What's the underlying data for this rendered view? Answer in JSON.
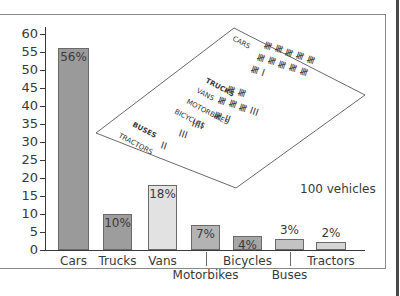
{
  "chart_data": {
    "type": "bar",
    "title": "",
    "xlabel": "",
    "ylabel": "",
    "ylim": [
      0,
      60
    ],
    "yticks": [
      0,
      5,
      10,
      15,
      20,
      25,
      30,
      35,
      40,
      45,
      50,
      55,
      60
    ],
    "categories": [
      "Cars",
      "Trucks",
      "Vans",
      "Motorbikes",
      "Bicycles",
      "Buses",
      "Tractors"
    ],
    "values": [
      56,
      10,
      18,
      7,
      4,
      3,
      2
    ],
    "value_labels": [
      "56%",
      "10%",
      "18%",
      "7%",
      "4%",
      "3%",
      "2%"
    ],
    "colors": [
      "#9a9a9a",
      "#9d9d9d",
      "#e2e2e2",
      "#b3b3b3",
      "#a6a6a6",
      "#c3c3c3",
      "#d6d6d6"
    ],
    "annotation": "100 vehicles",
    "grid": false,
    "legend": null
  },
  "paper": {
    "rows": [
      {
        "label": "CARS",
        "tally": "卌 卌 卌 卌 卌 卌 卌 卌 卌 卌 卌 I"
      },
      {
        "label": "TRUCKS",
        "tally": "卌 卌"
      },
      {
        "label": "VANS",
        "tally": "卌 卌 卌 III"
      },
      {
        "label": "MOTORBIKES",
        "tally": "卌 II"
      },
      {
        "label": "BICYCLES",
        "tally": "IIII"
      },
      {
        "label": "BUSES",
        "tally": "III"
      },
      {
        "label": "TRACTORS",
        "tally": "II"
      }
    ]
  }
}
